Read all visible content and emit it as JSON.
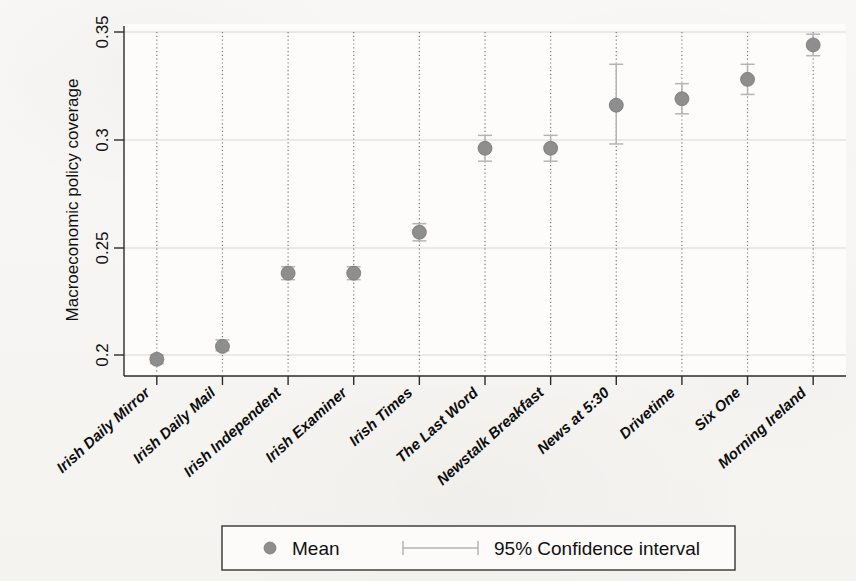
{
  "chart_data": {
    "type": "scatter",
    "title": "",
    "subtitle": "",
    "xlabel": "",
    "ylabel": "Macroeconomic policy coverage",
    "ylim": [
      0.19,
      0.353
    ],
    "yticks": [
      0.2,
      0.25,
      0.3,
      0.35
    ],
    "ytick_labels": [
      "0.2",
      "0.25",
      "0.3",
      "0.35"
    ],
    "grid": "vertical dotted drop-lines at each category; faint horizontal gridlines",
    "legend_position": "bottom-center",
    "categories": [
      "Irish Daily Mirror",
      "Irish Daily Mail",
      "Irish Independent",
      "Irish Examiner",
      "Irish Times",
      "The Last Word",
      "Newstalk Breakfast",
      "News at 5:30",
      "Drivetime",
      "Six One",
      "Morning Ireland"
    ],
    "series": [
      {
        "name": "Mean",
        "values": [
          0.198,
          0.204,
          0.238,
          0.238,
          0.257,
          0.296,
          0.296,
          0.316,
          0.319,
          0.328,
          0.344
        ]
      },
      {
        "name": "95% Confidence interval",
        "lower": [
          0.196,
          0.202,
          0.235,
          0.235,
          0.253,
          0.29,
          0.29,
          0.298,
          0.312,
          0.321,
          0.339
        ],
        "upper": [
          0.2,
          0.207,
          0.241,
          0.241,
          0.261,
          0.302,
          0.302,
          0.335,
          0.326,
          0.335,
          0.349
        ]
      }
    ],
    "marker_color": "#8e8e8e",
    "ci_color": "#b4b4b4"
  },
  "axes": {
    "y_axis_title": "Macroeconomic policy coverage",
    "y_tick_labels": [
      "0.35",
      "0.3",
      "0.25",
      "0.2"
    ],
    "x_tick_labels": [
      "Irish Daily Mirror",
      "Irish Daily Mail",
      "Irish Independent",
      "Irish Examiner",
      "Irish Times",
      "The Last Word",
      "Newstalk Breakfast",
      "News at 5:30",
      "Drivetime",
      "Six One",
      "Morning Ireland"
    ]
  },
  "legend": {
    "mean_label": "Mean",
    "ci_label": "95% Confidence interval",
    "mean_marker": "filled-circle-marker",
    "ci_marker": "capped-horizontal-line-marker"
  },
  "colors": {
    "marker": "#8e8e8e",
    "ci": "#b4b4b4",
    "axis": "#2b2b2b",
    "grid": "#7a7a7a",
    "text": "#111111",
    "background": "#f7f6f4"
  }
}
